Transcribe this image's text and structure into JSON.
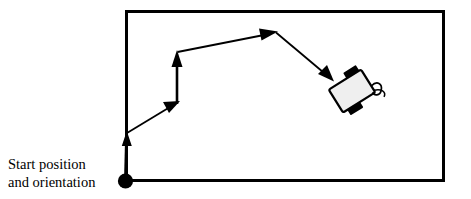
{
  "figure": {
    "background_color": "#ffffff",
    "width": 471,
    "height": 199
  },
  "caption": {
    "line1": "Start position",
    "line2": "and orientation",
    "full_text": "Start position and orientation",
    "font_color": "#000000"
  },
  "arena": {
    "name": "arena-border-rectangle",
    "x": 125,
    "y": 10,
    "width": 319,
    "height": 172,
    "stroke_color": "#000000",
    "stroke_width": 3,
    "fill": "none"
  },
  "start_marker": {
    "name": "start-position-dot",
    "cx": 125,
    "cy": 181,
    "r": 7.5,
    "color": "#000000"
  },
  "path": {
    "stroke_color": "#000000",
    "stroke_width": 2,
    "vertices": [
      {
        "x": 125,
        "y": 181,
        "label": "start"
      },
      {
        "x": 127,
        "y": 133,
        "label": "waypoint-1"
      },
      {
        "x": 177,
        "y": 103,
        "label": "waypoint-2"
      },
      {
        "x": 177,
        "y": 52,
        "label": "waypoint-3"
      },
      {
        "x": 276,
        "y": 32,
        "label": "waypoint-4"
      },
      {
        "x": 334,
        "y": 82,
        "label": "goal"
      }
    ],
    "segments": [
      {
        "name": "segment-1",
        "from": {
          "x": 125,
          "y": 181
        },
        "to": {
          "x": 127,
          "y": 140
        },
        "arrow_at": {
          "x": 127,
          "y": 133
        },
        "direction": "up"
      },
      {
        "name": "segment-2",
        "from": {
          "x": 127,
          "y": 133
        },
        "to": {
          "x": 172,
          "y": 106
        },
        "arrow_at": {
          "x": 178,
          "y": 102
        },
        "direction": "up-right"
      },
      {
        "name": "segment-3",
        "from": {
          "x": 177,
          "y": 103
        },
        "to": {
          "x": 177,
          "y": 60
        },
        "arrow_at": {
          "x": 177,
          "y": 52
        },
        "direction": "up"
      },
      {
        "name": "segment-4",
        "from": {
          "x": 177,
          "y": 52
        },
        "to": {
          "x": 266,
          "y": 34
        },
        "arrow_at": {
          "x": 276,
          "y": 32
        },
        "direction": "right-slight-up"
      },
      {
        "name": "segment-5",
        "from": {
          "x": 276,
          "y": 32
        },
        "to": {
          "x": 325,
          "y": 74
        },
        "arrow_at": {
          "x": 333,
          "y": 81
        },
        "direction": "down-right"
      }
    ]
  },
  "robot": {
    "name": "robot-icon",
    "center_x": 352,
    "center_y": 91,
    "rotation_deg": -32,
    "body": {
      "width": 38,
      "height": 27,
      "fill_color": "#efefef",
      "stroke_color": "#000000",
      "stroke_width": 2,
      "corner_radius": 2
    },
    "wheels": [
      {
        "name": "wheel-front-right",
        "color": "#000000"
      },
      {
        "name": "wheel-rear-left",
        "color": "#000000"
      }
    ],
    "caster_tail": {
      "name": "caster-tail",
      "color": "#000000",
      "stroke_width": 1.6
    }
  }
}
